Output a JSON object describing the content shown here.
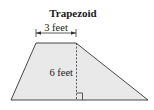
{
  "diagram": {
    "title": "Trapezoid",
    "shape": "trapezoid",
    "top_base_label": "3 feet",
    "height_label": "6 feet",
    "fill_color": "#e9e9e9",
    "stroke_color": "#333333",
    "vertices": {
      "top_left": [
        36,
        43
      ],
      "top_right": [
        76,
        43
      ],
      "bottom_right": [
        148,
        100
      ],
      "bottom_left": [
        11,
        100
      ]
    },
    "annotations": [
      "top base dimension arrow",
      "dashed height line",
      "right-angle marker"
    ]
  }
}
